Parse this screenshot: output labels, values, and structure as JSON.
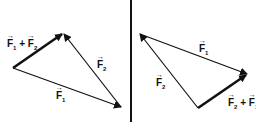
{
  "left": {
    "sum_label": {
      "a": "F",
      "a_sub": "1",
      "op": "+",
      "b": "F",
      "b_sub": "2"
    },
    "f1_label": {
      "a": "F",
      "a_sub": "1"
    },
    "f2_label": {
      "a": "F",
      "a_sub": "2"
    }
  },
  "right": {
    "sum_label": {
      "a": "F",
      "a_sub": "2",
      "op": "+",
      "b": "F",
      "b_sub": "1"
    },
    "f1_label": {
      "a": "F",
      "a_sub": "1"
    },
    "f2_label": {
      "a": "F",
      "a_sub": "2"
    }
  },
  "colors": {
    "stroke": "#111111",
    "background": "#ffffff"
  }
}
